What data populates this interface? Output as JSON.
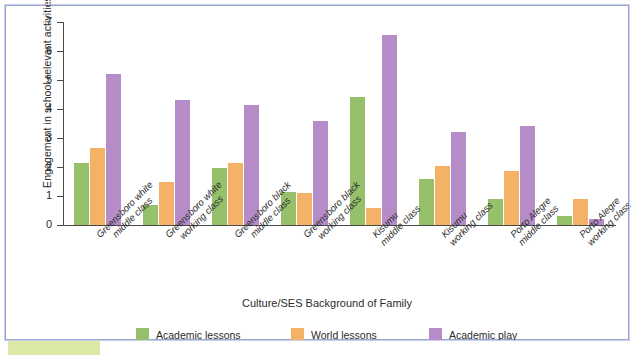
{
  "chart_data": {
    "type": "bar",
    "title": "",
    "xlabel": "Culture/SES Background of Family",
    "ylabel": "Engagement in school-relevant activities",
    "ylim": [
      0,
      7
    ],
    "yticks": [
      0,
      1,
      2,
      3,
      4,
      5,
      6,
      7
    ],
    "grid": false,
    "legend_position": "bottom",
    "categories": [
      "Greensboro white middle class",
      "Greensboro white working class",
      "Greensboro black middle class",
      "Greensboro black working class",
      "Kisumu middle class",
      "Kisumu working class",
      "Porto Alegre middle class",
      "Porto Alegre working class"
    ],
    "category_lines": [
      [
        "Greensboro white",
        "middle class"
      ],
      [
        "Greensboro white",
        "working class"
      ],
      [
        "Greensboro black",
        "middle class"
      ],
      [
        "Greensboro black",
        "working class"
      ],
      [
        "Kisumu",
        "middle class"
      ],
      [
        "Kisumu",
        "working class"
      ],
      [
        "Porto Alegre",
        "middle class"
      ],
      [
        "Porto Alegre",
        "working class"
      ]
    ],
    "series": [
      {
        "name": "Academic lessons",
        "color": "#96c06a",
        "values": [
          2.15,
          0.7,
          1.95,
          1.15,
          4.4,
          1.6,
          0.9,
          0.3
        ]
      },
      {
        "name": "World lessons",
        "color": "#f4b267",
        "values": [
          2.65,
          1.5,
          2.15,
          1.1,
          0.6,
          2.05,
          1.85,
          0.9
        ]
      },
      {
        "name": "Academic play",
        "color": "#b68cc8",
        "values": [
          5.2,
          4.3,
          4.15,
          3.6,
          6.55,
          3.2,
          3.4,
          0.2
        ]
      }
    ]
  },
  "legend": {
    "items": [
      {
        "label": "Academic lessons",
        "color": "#96c06a"
      },
      {
        "label": "World lessons",
        "color": "#f4b267"
      },
      {
        "label": "Academic play",
        "color": "#b68cc8"
      }
    ]
  },
  "frame": {
    "border_color": "#9aa6d4",
    "accent_tab_color": "#dbe9a6"
  }
}
